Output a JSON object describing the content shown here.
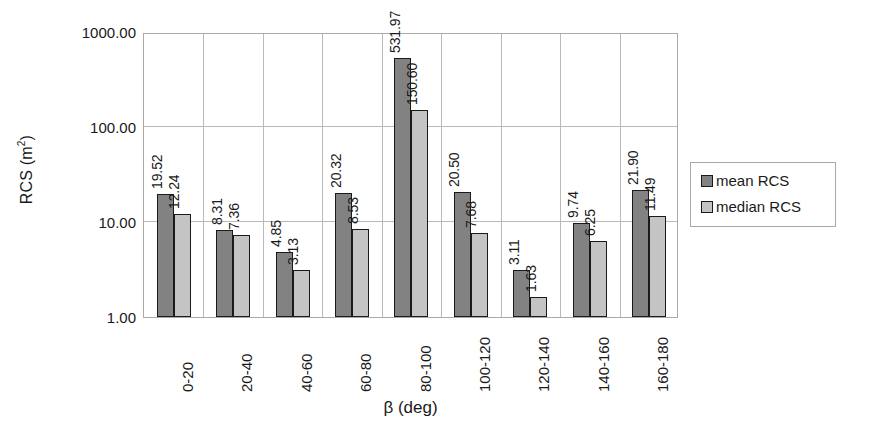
{
  "chart_data": {
    "type": "bar",
    "title": "",
    "xlabel": "β (deg)",
    "ylabel": "RCS (m²)",
    "yscale": "log",
    "ylim": [
      1.0,
      1000.0
    ],
    "ytick_labels": [
      "1000.00",
      "100.00",
      "10.00",
      "1.00"
    ],
    "ytick_values": [
      1000,
      100,
      10,
      1
    ],
    "grid": true,
    "legend_position": "right",
    "categories": [
      "0-20",
      "20-40",
      "40-60",
      "60-80",
      "80-100",
      "100-120",
      "120-140",
      "140-160",
      "160-180"
    ],
    "series": [
      {
        "name": "mean RCS",
        "color": "#828282",
        "values": [
          19.52,
          8.31,
          4.85,
          20.32,
          531.97,
          20.5,
          3.11,
          9.74,
          21.9
        ],
        "labels": [
          "19.52",
          "8.31",
          "4.85",
          "20.32",
          "531.97",
          "20.50",
          "3.11",
          "9.74",
          "21.90"
        ]
      },
      {
        "name": "median RCS",
        "color": "#c4c4c4",
        "values": [
          12.24,
          7.36,
          3.13,
          8.53,
          150.6,
          7.68,
          1.63,
          6.25,
          11.49
        ],
        "labels": [
          "12.24",
          "7.36",
          "3.13",
          "8.53",
          "150.60",
          "7.68",
          "1.63",
          "6.25",
          "11.49"
        ]
      }
    ]
  },
  "legend": {
    "items": [
      {
        "label": "mean RCS",
        "color": "#828282"
      },
      {
        "label": "median RCS",
        "color": "#c4c4c4"
      }
    ]
  },
  "axis": {
    "y_title_main": "RCS (m",
    "y_title_sup": "2",
    "y_title_tail": ")",
    "x_title": "β (deg)"
  }
}
